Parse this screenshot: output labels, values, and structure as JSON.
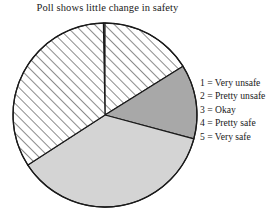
{
  "chart_data": {
    "type": "pie",
    "title": "Poll shows little change in safety",
    "xlabel": "",
    "ylabel": "",
    "categories": [
      "1 = Very unsafe",
      "2 = Pretty unsafe",
      "3 = Okay",
      "4 = Pretty safe",
      "5 = Very safe"
    ],
    "values": [
      1,
      16,
      13,
      45,
      25
    ],
    "slices": [
      {
        "key": "1",
        "label": "1 = Very unsafe",
        "value": 1,
        "start_angle_deg": 359,
        "end_angle_deg": 360,
        "fill": "#ffffff",
        "pattern": "solid-white"
      },
      {
        "key": "2",
        "label": "2 = Pretty unsafe",
        "value": 16,
        "start_angle_deg": 0,
        "end_angle_deg": 58,
        "fill": "#ffffff",
        "pattern": "diagonal-hatch"
      },
      {
        "key": "3",
        "label": "3 = Okay",
        "value": 13,
        "start_angle_deg": 58,
        "end_angle_deg": 105,
        "fill": "#a8a8a8",
        "pattern": "solid"
      },
      {
        "key": "4",
        "label": "4 = Pretty safe",
        "value": 45,
        "start_angle_deg": 105,
        "end_angle_deg": 237,
        "fill": "#d4d4d4",
        "pattern": "solid"
      },
      {
        "key": "5",
        "label": "5 = Very safe",
        "value": 25,
        "start_angle_deg": 237,
        "end_angle_deg": 359,
        "fill": "#ffffff",
        "pattern": "diagonal-hatch"
      }
    ],
    "legend_position": "right",
    "grid": false,
    "colors": {
      "outline": "#1a1a1a",
      "dark_gray": "#a8a8a8",
      "light_gray": "#d4d4d4",
      "hatch_background": "#ffffff",
      "hatch_line": "#777777",
      "text": "#1a1a1a",
      "background": "#ffffff"
    },
    "geometry": {
      "center_x": 105,
      "center_y": 115,
      "radius": 92
    }
  },
  "legend": {
    "entries": [
      {
        "text": "1 = Very unsafe"
      },
      {
        "text": "2 = Pretty unsafe"
      },
      {
        "text": "3 = Okay"
      },
      {
        "text": "4 = Pretty safe"
      },
      {
        "text": "5 = Very safe"
      }
    ]
  }
}
